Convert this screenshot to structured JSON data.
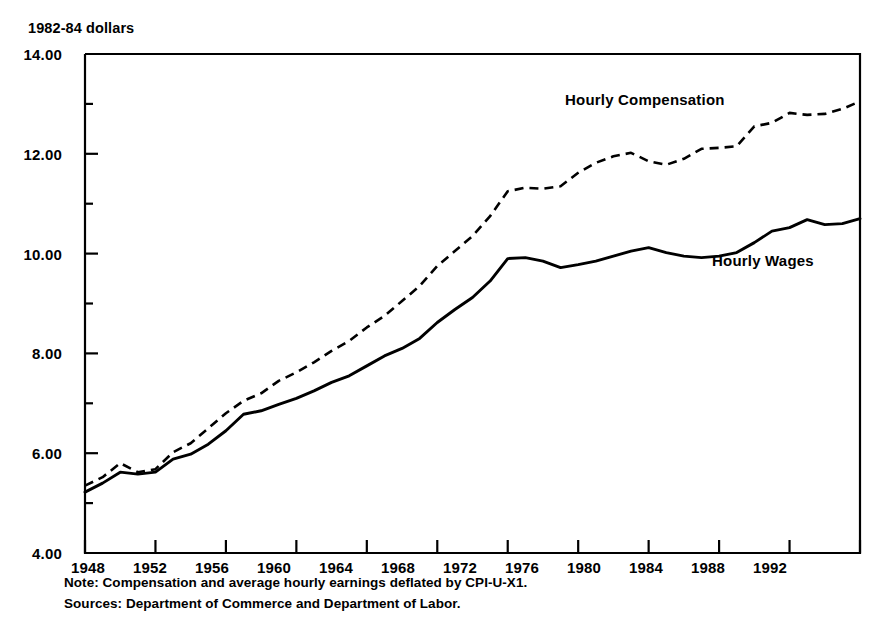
{
  "figure": {
    "y_axis_unit_label": "1982-84 dollars",
    "note": "Note: Compensation and average hourly earnings deflated by CPI-U-X1.",
    "sources": "Sources: Department of Commerce and Department of Labor."
  },
  "chart_data": {
    "type": "line",
    "title": "",
    "xlabel": "",
    "ylabel": "1982-84 dollars",
    "xlim": [
      1948,
      1992
    ],
    "ylim": [
      4.0,
      14.0
    ],
    "grid": false,
    "legend_position": "inline-annotation",
    "y_tick_labels": [
      "14.00",
      "12.00",
      "10.00",
      "8.00",
      "6.00",
      "4.00"
    ],
    "y_ticks_major": [
      14.0,
      12.0,
      10.0,
      8.0,
      6.0,
      4.0
    ],
    "y_ticks_minor": [
      13.0,
      11.0,
      9.0,
      7.0,
      5.0
    ],
    "x_tick_labels": [
      "1948",
      "1952",
      "1956",
      "1960",
      "1964",
      "1968",
      "1972",
      "1976",
      "1980",
      "1984",
      "1988",
      "1992"
    ],
    "x_ticks": [
      1948,
      1952,
      1956,
      1960,
      1964,
      1968,
      1972,
      1976,
      1980,
      1984,
      1988,
      1992
    ],
    "x": [
      1948,
      1949,
      1950,
      1951,
      1952,
      1953,
      1954,
      1955,
      1956,
      1957,
      1958,
      1959,
      1960,
      1961,
      1962,
      1963,
      1964,
      1965,
      1966,
      1967,
      1968,
      1969,
      1970,
      1971,
      1972,
      1973,
      1974,
      1975,
      1976,
      1977,
      1978,
      1979,
      1980,
      1981,
      1982,
      1983,
      1984,
      1985,
      1986,
      1987,
      1988,
      1989,
      1990,
      1991,
      1992
    ],
    "series": [
      {
        "name": "Hourly Compensation",
        "style": "dashed",
        "color": "#000000",
        "values": [
          5.35,
          5.52,
          5.8,
          5.62,
          5.68,
          6.02,
          6.2,
          6.5,
          6.8,
          7.05,
          7.2,
          7.45,
          7.62,
          7.82,
          8.05,
          8.25,
          8.52,
          8.75,
          9.05,
          9.35,
          9.75,
          10.05,
          10.35,
          10.75,
          11.25,
          11.32,
          11.3,
          11.35,
          11.62,
          11.82,
          11.95,
          12.02,
          11.85,
          11.78,
          11.9,
          12.1,
          12.12,
          12.15,
          12.55,
          12.62,
          12.82,
          12.78,
          12.8,
          12.9,
          13.05
        ],
        "label_position": {
          "x": 1980,
          "y": 13.3
        }
      },
      {
        "name": "Hourly Wages",
        "style": "solid",
        "color": "#000000",
        "values": [
          5.22,
          5.4,
          5.62,
          5.58,
          5.62,
          5.88,
          5.98,
          6.18,
          6.45,
          6.78,
          6.85,
          6.98,
          7.1,
          7.25,
          7.42,
          7.55,
          7.75,
          7.95,
          8.1,
          8.3,
          8.62,
          8.88,
          9.12,
          9.45,
          9.9,
          9.92,
          9.85,
          9.72,
          9.78,
          9.85,
          9.95,
          10.05,
          10.12,
          10.02,
          9.95,
          9.92,
          9.95,
          10.02,
          10.22,
          10.45,
          10.52,
          10.68,
          10.58,
          10.6,
          10.7
        ],
        "label_position": {
          "x": 1985,
          "y": 9.45
        }
      }
    ]
  }
}
